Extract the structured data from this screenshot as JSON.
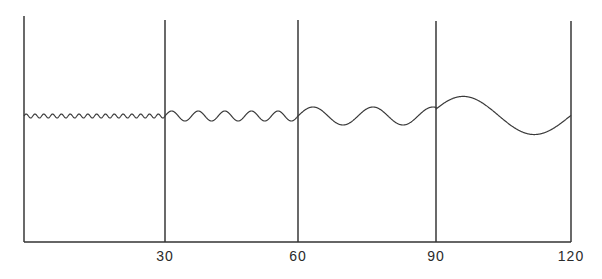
{
  "chart_data": {
    "type": "line",
    "title": "",
    "xlabel": "",
    "ylabel": "",
    "xlim": [
      0,
      120
    ],
    "ylim": [
      -1,
      1
    ],
    "grid": false,
    "x_ticks": [
      {
        "value": 30,
        "label": "30"
      },
      {
        "value": 60,
        "label": "60"
      },
      {
        "value": 90,
        "label": "90"
      },
      {
        "value": 120,
        "label": "120"
      }
    ],
    "dividers": [
      0,
      30,
      60,
      90,
      120
    ],
    "series": [
      {
        "name": "wave",
        "description": "Sinusoidal wave whose wavelength and amplitude increase from left to right across four 30-unit segments",
        "segments": [
          {
            "x_start": 0,
            "x_end": 30,
            "cycles": 16,
            "amplitude": 0.02,
            "phase_offset": 0
          },
          {
            "x_start": 30,
            "x_end": 60,
            "cycles": 5,
            "amplitude": 0.05,
            "phase_offset": 0
          },
          {
            "x_start": 60,
            "x_end": 90,
            "cycles": 2.3,
            "amplitude": 0.09,
            "phase_offset": 0
          },
          {
            "x_start": 90,
            "x_end": 120,
            "cycles": 1.0,
            "amplitude": 0.2,
            "phase_offset": 0
          }
        ]
      }
    ]
  }
}
